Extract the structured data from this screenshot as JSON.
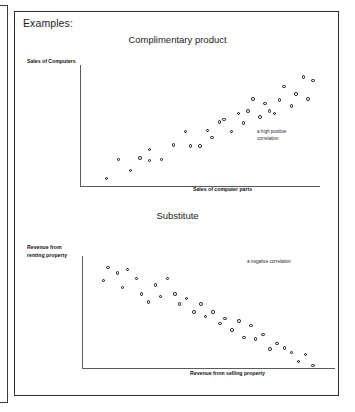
{
  "page": {
    "heading": "Examples:"
  },
  "charts": [
    {
      "id": "complimentary",
      "title": "Complimentary product",
      "ylabel": "Sales of Computers",
      "xlabel": "Sales of computer parts",
      "annotation_line1": "a high positive",
      "annotation_line2": "correlation"
    },
    {
      "id": "substitute",
      "title": "Substitute",
      "ylabel_line1": "Revenue from",
      "ylabel_line2": "renting property",
      "xlabel": "Revenue from selling property",
      "annotation": "a negative correlation"
    }
  ],
  "colors": {
    "frame_border": "#2e2e2e",
    "axis_line": "#5b5b5b",
    "marker_fill": "#e9e9e9",
    "marker_stroke": "#121212",
    "text": "#1d1d1d",
    "background": "#ffffff"
  },
  "chart_data": [
    {
      "type": "scatter",
      "title": "Complimentary product",
      "xlabel": "Sales of computer parts",
      "ylabel": "Sales of Computers",
      "annotation": "a high positive correlation",
      "grid": false,
      "legend": "none",
      "xlim": [
        0,
        100
      ],
      "ylim": [
        0,
        100
      ],
      "points": [
        {
          "x": 11,
          "y": 6
        },
        {
          "x": 16,
          "y": 22
        },
        {
          "x": 21,
          "y": 13
        },
        {
          "x": 25,
          "y": 23
        },
        {
          "x": 29,
          "y": 21
        },
        {
          "x": 29,
          "y": 30
        },
        {
          "x": 34,
          "y": 22
        },
        {
          "x": 39,
          "y": 34
        },
        {
          "x": 44,
          "y": 45
        },
        {
          "x": 46,
          "y": 33
        },
        {
          "x": 50,
          "y": 33
        },
        {
          "x": 53,
          "y": 46
        },
        {
          "x": 55,
          "y": 40
        },
        {
          "x": 58,
          "y": 53
        },
        {
          "x": 60,
          "y": 55
        },
        {
          "x": 63,
          "y": 45
        },
        {
          "x": 66,
          "y": 60
        },
        {
          "x": 68,
          "y": 52
        },
        {
          "x": 70,
          "y": 62
        },
        {
          "x": 72,
          "y": 72
        },
        {
          "x": 75,
          "y": 57
        },
        {
          "x": 77,
          "y": 68
        },
        {
          "x": 79,
          "y": 62
        },
        {
          "x": 81,
          "y": 60
        },
        {
          "x": 83,
          "y": 71
        },
        {
          "x": 85,
          "y": 82
        },
        {
          "x": 88,
          "y": 66
        },
        {
          "x": 90,
          "y": 76
        },
        {
          "x": 93,
          "y": 90
        },
        {
          "x": 95,
          "y": 72
        },
        {
          "x": 97,
          "y": 87
        }
      ]
    },
    {
      "type": "scatter",
      "title": "Substitute",
      "xlabel": "Revenue from selling property",
      "ylabel": "Revenue from renting property",
      "annotation": "a negative correlation",
      "grid": false,
      "legend": "none",
      "xlim": [
        0,
        100
      ],
      "ylim": [
        0,
        100
      ],
      "points": [
        {
          "x": 9,
          "y": 78
        },
        {
          "x": 11,
          "y": 90
        },
        {
          "x": 15,
          "y": 85
        },
        {
          "x": 17,
          "y": 72
        },
        {
          "x": 19,
          "y": 88
        },
        {
          "x": 23,
          "y": 80
        },
        {
          "x": 25,
          "y": 66
        },
        {
          "x": 28,
          "y": 59
        },
        {
          "x": 31,
          "y": 74
        },
        {
          "x": 33,
          "y": 64
        },
        {
          "x": 36,
          "y": 80
        },
        {
          "x": 39,
          "y": 66
        },
        {
          "x": 41,
          "y": 57
        },
        {
          "x": 44,
          "y": 62
        },
        {
          "x": 47,
          "y": 50
        },
        {
          "x": 50,
          "y": 57
        },
        {
          "x": 52,
          "y": 46
        },
        {
          "x": 55,
          "y": 50
        },
        {
          "x": 58,
          "y": 40
        },
        {
          "x": 60,
          "y": 44
        },
        {
          "x": 63,
          "y": 34
        },
        {
          "x": 66,
          "y": 42
        },
        {
          "x": 68,
          "y": 27
        },
        {
          "x": 71,
          "y": 38
        },
        {
          "x": 73,
          "y": 26
        },
        {
          "x": 76,
          "y": 30
        },
        {
          "x": 79,
          "y": 17
        },
        {
          "x": 82,
          "y": 22
        },
        {
          "x": 85,
          "y": 18
        },
        {
          "x": 88,
          "y": 14
        },
        {
          "x": 91,
          "y": 6
        },
        {
          "x": 94,
          "y": 12
        },
        {
          "x": 97,
          "y": 2
        }
      ]
    }
  ]
}
